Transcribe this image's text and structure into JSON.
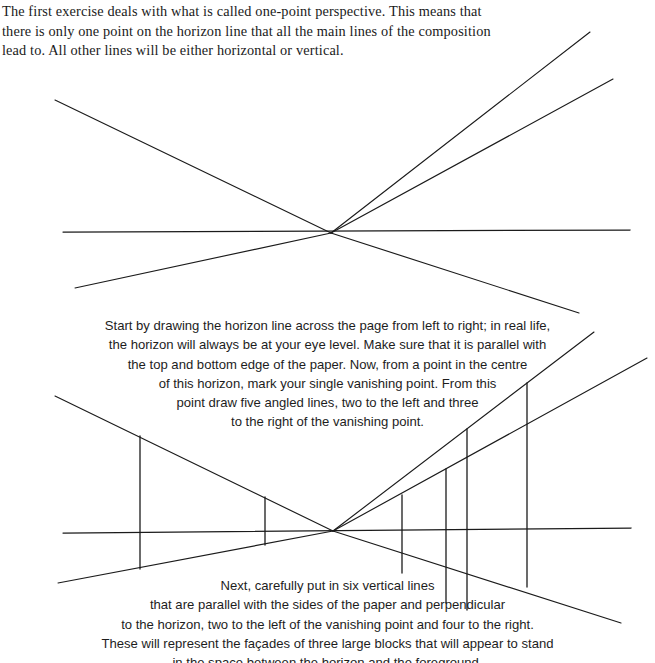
{
  "page": {
    "background_color": "#ffffff",
    "ink_color": "#1b1b1b",
    "width": 655,
    "height": 663
  },
  "intro": {
    "paragraph": "The first exercise deals with what is called one-point perspective. This means that there is only one point on the horizon line that all the main lines of the composition lead to. All other lines will be either horizontal or vertical."
  },
  "caption_middle": {
    "lines": [
      "Start by drawing the horizon line across the page from left to right; in real life,",
      "the horizon will always be at your eye level. Make sure that it is parallel with",
      "the top and bottom edge of the paper. Now, from a point in the centre",
      "of this horizon, mark your single vanishing point. From this",
      "point draw five angled lines, two to the left and three",
      "to the right of the vanishing point."
    ]
  },
  "caption_bottom": {
    "lines": [
      "Next, carefully put in six vertical lines",
      "that are parallel with the sides of the paper and perpendicular",
      "to the horizon, two to the left of the vanishing point and four to the right.",
      "These will represent the façades of three large blocks that will appear to stand",
      "in the space between the horizon and the foreground."
    ]
  },
  "diagram_top": {
    "label": "one-point perspective: horizon and five angled lines",
    "vanishing_point": {
      "x": 331,
      "y": 233
    },
    "horizon": {
      "x1": 63,
      "y1": 232,
      "x2": 630,
      "y2": 230
    },
    "rays": [
      {
        "name": "ray-upper-left",
        "x1": 55,
        "y1": 100,
        "x2": 331,
        "y2": 233
      },
      {
        "name": "ray-lower-left",
        "x1": 75,
        "y1": 288,
        "x2": 331,
        "y2": 233
      },
      {
        "name": "ray-upper-right-steep",
        "x1": 331,
        "y1": 233,
        "x2": 590,
        "y2": 32
      },
      {
        "name": "ray-upper-right-shallow",
        "x1": 331,
        "y1": 233,
        "x2": 613,
        "y2": 79
      },
      {
        "name": "ray-lower-right",
        "x1": 331,
        "y1": 233,
        "x2": 579,
        "y2": 313
      }
    ]
  },
  "diagram_bottom": {
    "label": "one-point perspective: horizon, five angled lines and six verticals",
    "vanishing_point": {
      "x": 333,
      "y": 531
    },
    "horizon": {
      "x1": 63,
      "y1": 533,
      "x2": 631,
      "y2": 528
    },
    "rays": [
      {
        "name": "ray-upper-left",
        "x1": 55,
        "y1": 396,
        "x2": 333,
        "y2": 531
      },
      {
        "name": "ray-lower-left",
        "x1": 58,
        "y1": 583,
        "x2": 333,
        "y2": 531
      },
      {
        "name": "ray-upper-right-steep",
        "x1": 333,
        "y1": 531,
        "x2": 594,
        "y2": 332
      },
      {
        "name": "ray-upper-right-shallow",
        "x1": 333,
        "y1": 531,
        "x2": 647,
        "y2": 358
      },
      {
        "name": "ray-lower-right",
        "x1": 333,
        "y1": 531,
        "x2": 621,
        "y2": 623
      }
    ],
    "verticals": [
      {
        "name": "vertical-left-outer",
        "x": 140,
        "y1": 436,
        "y2": 569
      },
      {
        "name": "vertical-left-inner",
        "x": 265,
        "y1": 497,
        "y2": 545
      },
      {
        "name": "vertical-right-1",
        "x": 402,
        "y1": 495,
        "y2": 573
      },
      {
        "name": "vertical-right-2",
        "x": 446,
        "y1": 469,
        "y2": 603
      },
      {
        "name": "vertical-right-3",
        "x": 467,
        "y1": 429,
        "y2": 610
      },
      {
        "name": "vertical-right-4",
        "x": 527,
        "y1": 383,
        "y2": 587
      }
    ]
  }
}
